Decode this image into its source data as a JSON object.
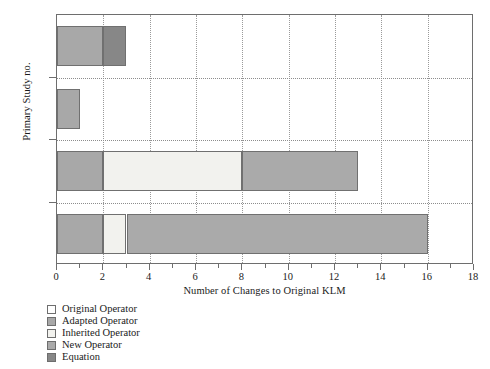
{
  "chart_data": {
    "type": "bar",
    "orientation": "horizontal",
    "stacked": true,
    "title": "",
    "xlabel": "Number of Changes to Original KLM",
    "ylabel": "Primary Study no.",
    "categories": [
      "PS14",
      "PS52",
      "PS61",
      "PS62"
    ],
    "xlim": [
      0,
      18
    ],
    "xticks": [
      0,
      2,
      4,
      6,
      8,
      10,
      12,
      14,
      16,
      18
    ],
    "xtick_labels": [
      "0",
      "2",
      "4",
      "6",
      "8",
      "10",
      "12",
      "14",
      "16",
      "18"
    ],
    "xminor_ticks": [
      1,
      3,
      5,
      7,
      9,
      11,
      13,
      15,
      17
    ],
    "grid": true,
    "grid_style": "dotted",
    "legend_position": "below-plot",
    "series": [
      {
        "name": "Original Operator",
        "color": "#ffffff",
        "values": [
          0,
          0,
          0,
          0
        ]
      },
      {
        "name": "Adapted Operator",
        "color": "#a8a8a8",
        "values": [
          2,
          1,
          2,
          2
        ]
      },
      {
        "name": "Inherited Operator",
        "color": "#f2f2ee",
        "values": [
          0,
          0,
          6,
          1
        ]
      },
      {
        "name": "New Operator",
        "color": "#aaaaaa",
        "values": [
          0,
          0,
          5,
          13
        ]
      },
      {
        "name": "Equation",
        "color": "#878787",
        "values": [
          1,
          0,
          0,
          0
        ]
      }
    ],
    "totals": [
      3,
      1,
      13,
      16
    ]
  },
  "legend": {
    "items": [
      {
        "label": "Original Operator",
        "color": "#ffffff"
      },
      {
        "label": "Adapted Operator",
        "color": "#a8a8a8"
      },
      {
        "label": "Inherited Operator",
        "color": "#f2f2ee"
      },
      {
        "label": "New Operator",
        "color": "#aaaaaa"
      },
      {
        "label": "Equation",
        "color": "#878787"
      }
    ]
  },
  "style": {
    "axis_color": "#6e6e6e",
    "grid_color": "#9a9a9a",
    "bar_edge_color": "#707070",
    "background": "#ffffff"
  }
}
